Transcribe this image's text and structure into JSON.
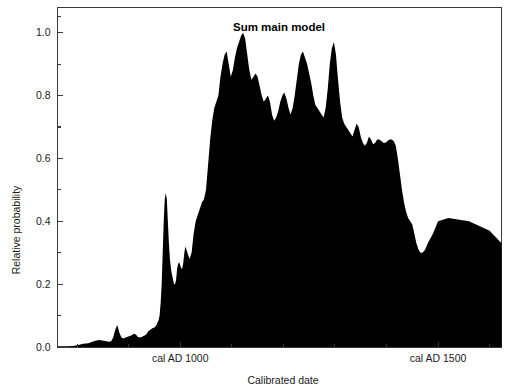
{
  "chart_data": {
    "type": "area",
    "title": "Sum main model",
    "xlabel": "Calibrated date",
    "ylabel": "Relative probability",
    "xlim": [
      762,
      1623
    ],
    "ylim": [
      0,
      1.08
    ],
    "grid": false,
    "legend": null,
    "x_tick_labels": [
      "cal AD 1000",
      "cal AD 1500"
    ],
    "x_tick_values": [
      1000,
      1500
    ],
    "x_minor_tick_values": [
      800,
      900,
      1100,
      1200,
      1300,
      1400,
      1600
    ],
    "y_tick_labels": [
      "0.0",
      "0.2",
      "0.4",
      "0.6",
      "0.8",
      "1.0"
    ],
    "y_tick_values": [
      0.0,
      0.2,
      0.4,
      0.6,
      0.8,
      1.0
    ],
    "y_minor_tick_values": [
      0.1,
      0.3,
      0.5,
      0.7,
      0.9,
      1.05
    ],
    "series_name": "Summed probability distribution",
    "fill_color": "#000000",
    "x": [
      762,
      772,
      782,
      792,
      802,
      812,
      822,
      832,
      842,
      852,
      862,
      866,
      870,
      874,
      878,
      882,
      886,
      890,
      894,
      898,
      902,
      906,
      910,
      914,
      918,
      922,
      926,
      930,
      934,
      938,
      942,
      946,
      950,
      954,
      958,
      960,
      962,
      964,
      966,
      968,
      970,
      972,
      974,
      976,
      978,
      980,
      982,
      984,
      986,
      988,
      990,
      992,
      994,
      996,
      998,
      1000,
      1002,
      1004,
      1006,
      1008,
      1010,
      1014,
      1018,
      1022,
      1026,
      1030,
      1034,
      1038,
      1042,
      1046,
      1050,
      1054,
      1058,
      1062,
      1066,
      1070,
      1074,
      1078,
      1082,
      1086,
      1090,
      1094,
      1098,
      1102,
      1106,
      1110,
      1114,
      1118,
      1122,
      1126,
      1130,
      1134,
      1138,
      1142,
      1146,
      1150,
      1154,
      1158,
      1162,
      1166,
      1170,
      1174,
      1178,
      1182,
      1186,
      1190,
      1194,
      1198,
      1202,
      1206,
      1210,
      1214,
      1218,
      1222,
      1226,
      1230,
      1234,
      1238,
      1242,
      1246,
      1250,
      1254,
      1258,
      1262,
      1266,
      1270,
      1274,
      1278,
      1282,
      1286,
      1290,
      1294,
      1298,
      1302,
      1306,
      1310,
      1314,
      1318,
      1322,
      1326,
      1330,
      1334,
      1338,
      1342,
      1346,
      1350,
      1354,
      1358,
      1362,
      1366,
      1370,
      1374,
      1378,
      1382,
      1386,
      1390,
      1394,
      1398,
      1402,
      1406,
      1410,
      1414,
      1418,
      1422,
      1426,
      1430,
      1434,
      1438,
      1442,
      1446,
      1450,
      1454,
      1458,
      1462,
      1466,
      1470,
      1475,
      1480,
      1490,
      1500,
      1520,
      1560,
      1600,
      1623
    ],
    "y": [
      0.0,
      0.0,
      0.0,
      0.003,
      0.006,
      0.01,
      0.012,
      0.018,
      0.022,
      0.02,
      0.017,
      0.018,
      0.03,
      0.055,
      0.07,
      0.045,
      0.03,
      0.027,
      0.03,
      0.033,
      0.035,
      0.037,
      0.042,
      0.04,
      0.032,
      0.03,
      0.033,
      0.036,
      0.04,
      0.05,
      0.055,
      0.06,
      0.062,
      0.07,
      0.085,
      0.1,
      0.14,
      0.2,
      0.3,
      0.4,
      0.47,
      0.49,
      0.47,
      0.4,
      0.33,
      0.28,
      0.25,
      0.23,
      0.215,
      0.2,
      0.2,
      0.215,
      0.25,
      0.265,
      0.27,
      0.26,
      0.25,
      0.25,
      0.27,
      0.3,
      0.32,
      0.3,
      0.28,
      0.3,
      0.36,
      0.4,
      0.42,
      0.44,
      0.46,
      0.47,
      0.5,
      0.58,
      0.66,
      0.72,
      0.76,
      0.78,
      0.8,
      0.86,
      0.9,
      0.93,
      0.94,
      0.9,
      0.86,
      0.88,
      0.92,
      0.95,
      0.97,
      0.99,
      1.0,
      0.98,
      0.93,
      0.88,
      0.85,
      0.86,
      0.87,
      0.86,
      0.83,
      0.8,
      0.78,
      0.79,
      0.8,
      0.78,
      0.74,
      0.72,
      0.73,
      0.75,
      0.78,
      0.8,
      0.81,
      0.79,
      0.76,
      0.74,
      0.76,
      0.8,
      0.85,
      0.9,
      0.93,
      0.94,
      0.92,
      0.9,
      0.87,
      0.84,
      0.8,
      0.77,
      0.76,
      0.75,
      0.74,
      0.73,
      0.76,
      0.82,
      0.9,
      0.95,
      0.97,
      0.93,
      0.85,
      0.78,
      0.73,
      0.71,
      0.7,
      0.69,
      0.68,
      0.67,
      0.69,
      0.71,
      0.7,
      0.67,
      0.65,
      0.64,
      0.65,
      0.67,
      0.66,
      0.645,
      0.65,
      0.66,
      0.66,
      0.655,
      0.65,
      0.65,
      0.655,
      0.66,
      0.66,
      0.655,
      0.64,
      0.6,
      0.55,
      0.5,
      0.46,
      0.43,
      0.41,
      0.4,
      0.39,
      0.36,
      0.33,
      0.31,
      0.3,
      0.3,
      0.31,
      0.33,
      0.36,
      0.4,
      0.41,
      0.4,
      0.37,
      0.33,
      0.3,
      0.27,
      0.24,
      0.2,
      0.15,
      0.1,
      0.06,
      0.03,
      0.015,
      0.008,
      0.004,
      0.002,
      0.0,
      0.0
    ]
  },
  "figure": {
    "background_color": "#ffffff",
    "border_color": "#3a3a3a"
  }
}
